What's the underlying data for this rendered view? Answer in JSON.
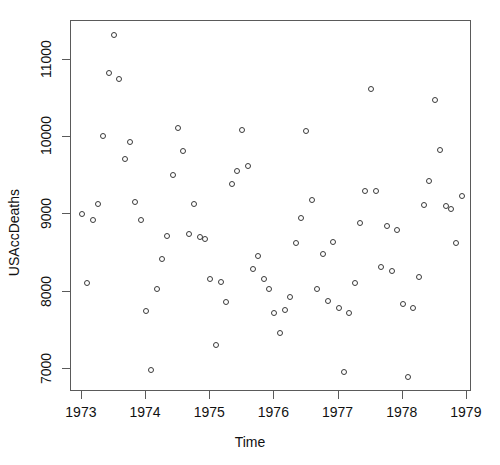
{
  "chart_data": {
    "type": "scatter",
    "title": "",
    "xlabel": "Time",
    "ylabel": "USAccDeaths",
    "xlim": [
      1972.83,
      1979.08
    ],
    "ylim": [
      6700,
      11500
    ],
    "xticks": [
      1973,
      1974,
      1975,
      1976,
      1977,
      1978,
      1979
    ],
    "xtick_labels": [
      "1973",
      "1974",
      "1975",
      "1976",
      "1977",
      "1978",
      "1979"
    ],
    "yticks": [
      7000,
      8000,
      9000,
      10000,
      11000
    ],
    "ytick_labels": [
      "7000",
      "8000",
      "9000",
      "10000",
      "11000"
    ],
    "grid": false,
    "legend": null,
    "marker": "open-circle",
    "marker_color": "#3a3a3a",
    "marker_size": 6,
    "x": [
      1973.0,
      1973.083,
      1973.167,
      1973.25,
      1973.333,
      1973.417,
      1973.5,
      1973.583,
      1973.667,
      1973.75,
      1973.833,
      1973.917,
      1974.0,
      1974.083,
      1974.167,
      1974.25,
      1974.333,
      1974.417,
      1974.5,
      1974.583,
      1974.667,
      1974.75,
      1974.833,
      1974.917,
      1975.0,
      1975.083,
      1975.167,
      1975.25,
      1975.333,
      1975.417,
      1975.5,
      1975.583,
      1975.667,
      1975.75,
      1975.833,
      1975.917,
      1976.0,
      1976.083,
      1976.167,
      1976.25,
      1976.333,
      1976.417,
      1976.5,
      1976.583,
      1976.667,
      1976.75,
      1976.833,
      1976.917,
      1977.0,
      1977.083,
      1977.167,
      1977.25,
      1977.333,
      1977.417,
      1977.5,
      1977.583,
      1977.667,
      1977.75,
      1977.833,
      1977.917,
      1978.0,
      1978.083,
      1978.167,
      1978.25,
      1978.333,
      1978.417,
      1978.5,
      1978.583,
      1978.667,
      1978.75,
      1978.833,
      1978.917
    ],
    "y": [
      9007,
      8106,
      8928,
      9137,
      10017,
      10826,
      11317,
      10744,
      9713,
      9938,
      9161,
      8927,
      7750,
      6981,
      8038,
      8422,
      8714,
      9512,
      10120,
      9823,
      8743,
      9129,
      8710,
      8680,
      8162,
      7306,
      8124,
      7870,
      9387,
      9556,
      10093,
      9620,
      8285,
      8466,
      8160,
      8034,
      7717,
      7461,
      7767,
      7925,
      8623,
      8945,
      10078,
      9179,
      8037,
      8488,
      7874,
      8647,
      7792,
      6957,
      7726,
      8106,
      8890,
      9299,
      10625,
      9302,
      8314,
      8850,
      8265,
      8796,
      7836,
      6892,
      7791,
      8192,
      9115,
      9434,
      10484,
      9827,
      9110,
      9070,
      8633,
      9240
    ],
    "n_points": 72,
    "x_unit": "year"
  },
  "axes": {
    "x_title": "Time",
    "y_title": "USAccDeaths"
  }
}
